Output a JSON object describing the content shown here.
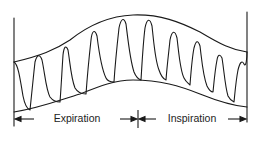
{
  "diagram": {
    "type": "respiratory-variation-waveform",
    "labels": {
      "expiration": "Expiration",
      "inspiration": "Inspiration"
    },
    "colors": {
      "line": "#1a1a1a",
      "background": "#ffffff"
    },
    "phases": [
      {
        "name": "Expiration",
        "x_start": 14,
        "x_end": 138
      },
      {
        "name": "Inspiration",
        "x_start": 138,
        "x_end": 247
      }
    ],
    "beat_count": 12
  }
}
